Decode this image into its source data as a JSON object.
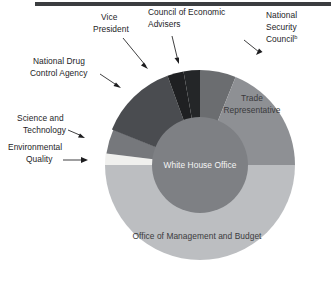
{
  "figure": {
    "name": "executive-office-president-donut",
    "center_label": "White House Office",
    "background_color": "#ffffff",
    "top_rule_color": "#3b3d40"
  },
  "chart_data": {
    "type": "pie",
    "title": "",
    "subtitle": "",
    "xlabel": "",
    "ylabel": "",
    "grid": false,
    "legend_position": "none",
    "donut": true,
    "inner_label": "White House Office",
    "start_angle_deg": 0,
    "direction": "clockwise",
    "categories": [
      "National Security Council",
      "Trade Representative",
      "Office of Management and Budget",
      "Environmental Quality",
      "Science and Technology",
      "National Drug Control Agency",
      "Vice President",
      "Council of Economic Advisers"
    ],
    "values": [
      22,
      68,
      180,
      7,
      15,
      48,
      10,
      10
    ],
    "value_unit": "degrees of arc",
    "colors": [
      "#6b6d70",
      "#8e9094",
      "#bcbec1",
      "#f0f0ee",
      "#76787c",
      "#4a4c50",
      "#1f2022",
      "#242628"
    ],
    "slices": [
      {
        "label": "National Security Council",
        "superscript": "b",
        "start_deg": 0,
        "end_deg": 22,
        "color": "#6b6d70",
        "label_placement": "outside-callout"
      },
      {
        "label": "Trade Representative",
        "superscript": "",
        "start_deg": 22,
        "end_deg": 90,
        "color": "#8e9094",
        "label_placement": "inside"
      },
      {
        "label": "Office of Management and Budget",
        "superscript": "",
        "start_deg": 90,
        "end_deg": 270,
        "color": "#bcbec1",
        "label_placement": "inside"
      },
      {
        "label": "Environmental Quality",
        "superscript": "",
        "start_deg": 270,
        "end_deg": 277,
        "color": "#f0f0ee",
        "label_placement": "outside-callout"
      },
      {
        "label": "Science and Technology",
        "superscript": "",
        "start_deg": 277,
        "end_deg": 292,
        "color": "#76787c",
        "label_placement": "outside-callout"
      },
      {
        "label": "National Drug Control Agency",
        "superscript": "",
        "start_deg": 292,
        "end_deg": 340,
        "color": "#4a4c50",
        "label_placement": "outside-callout"
      },
      {
        "label": "Vice President",
        "superscript": "",
        "start_deg": 340,
        "end_deg": 350,
        "color": "#1f2022",
        "label_placement": "outside-callout"
      },
      {
        "label": "Council of Economic Advisers",
        "superscript": "",
        "start_deg": 350,
        "end_deg": 360,
        "color": "#242628",
        "label_placement": "outside-callout"
      }
    ]
  },
  "callouts": {
    "vice_president_line1": "Vice",
    "vice_president_line2": "President",
    "council_economic_line1": "Council of Economic",
    "council_economic_line2": "Advisers",
    "national_security_line1": "National",
    "national_security_line2": "Security",
    "national_security_line3": "Council",
    "national_security_superscript": "b",
    "national_drug_line1": "National Drug",
    "national_drug_line2": "Control Agency",
    "science_tech_line1": "Science and",
    "science_tech_line2": "Technology",
    "environmental_line1": "Environmental",
    "environmental_line2": "Quality"
  },
  "inside_labels": {
    "trade_line1": "Trade",
    "trade_line2": "Representative",
    "omb": "Office of Management and Budget",
    "white_house_office": "White House Office"
  }
}
